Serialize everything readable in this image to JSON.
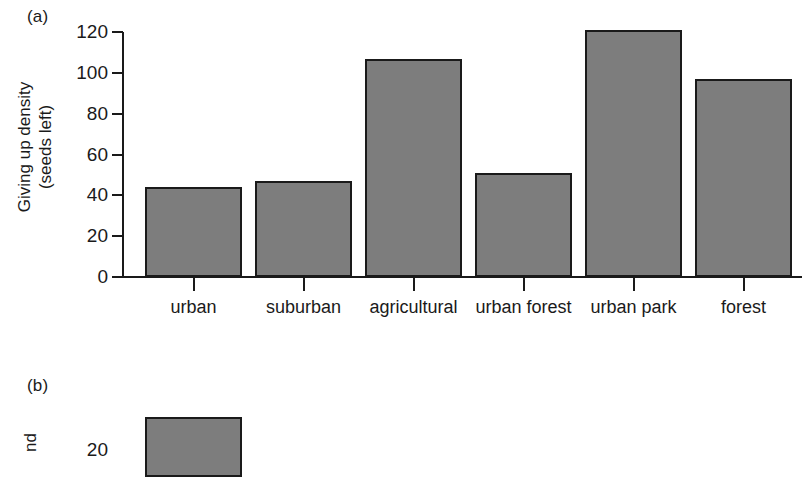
{
  "figure": {
    "background": "#ffffff",
    "bar_fill": "#7d7d7d",
    "bar_stroke": "#1a1a1a"
  },
  "panel_a": {
    "tag": "(a)",
    "ytitle_line1": "Giving up density",
    "ytitle_line2": "(seeds left)"
  },
  "panel_b": {
    "tag": "(b)",
    "ytitle_partial": "nd",
    "ytick_label_partial": "20"
  },
  "chart_data": [
    {
      "type": "bar",
      "title": "(a)",
      "xlabel": "",
      "ylabel": "Giving up density (seeds left)",
      "categories": [
        "urban",
        "suburban",
        "agricultural",
        "urban forest",
        "urban park",
        "forest"
      ],
      "values": [
        44,
        47,
        107,
        51,
        121,
        97
      ],
      "yticks": [
        0,
        20,
        40,
        60,
        80,
        100,
        120
      ],
      "ytick_labels": [
        "0",
        "20",
        "40",
        "60",
        "80",
        "100",
        "120"
      ],
      "ylim": [
        0,
        120
      ],
      "grid": false,
      "legend": false
    },
    {
      "type": "bar",
      "title": "(b)",
      "note": "panel cropped at image edge; only partial axis label and top of first bar visible",
      "categories": [],
      "values": [],
      "ytick_labels": [
        "20"
      ],
      "grid": false,
      "legend": false
    }
  ]
}
